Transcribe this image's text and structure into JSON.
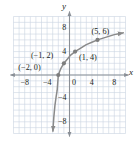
{
  "figure": {
    "title": "",
    "axis_labels": {
      "x": "x",
      "y": "y"
    },
    "colors": {
      "grid": "#c9d4e0",
      "axis": "#8a8f96",
      "curve": "#8a8a8a",
      "point": "#7d7d7d",
      "text": "#231f20",
      "background": "#ffffff"
    }
  },
  "chart_data": {
    "type": "line",
    "title": "",
    "xlabel": "x",
    "ylabel": "y",
    "xlim": [
      -10,
      10
    ],
    "ylim": [
      -10,
      10
    ],
    "grid": true,
    "grid_step": 1,
    "legend": "none",
    "xticks": [
      -8,
      -4,
      0,
      4,
      8
    ],
    "xtick_labels": [
      "-8",
      "-4",
      "0",
      "4",
      "8"
    ],
    "yticks": [
      8,
      4,
      -4,
      -8
    ],
    "ytick_labels": [
      "8",
      "4",
      "-4",
      "-8"
    ],
    "origin_label": "0",
    "asymptote": {
      "type": "vertical",
      "x": -3
    },
    "series": [
      {
        "name": "curve",
        "x": [
          -2.96,
          -2.9,
          -2.8,
          -2.6,
          -2.4,
          -2.2,
          -2,
          -1.6,
          -1.2,
          -1,
          -0.4,
          0.2,
          1,
          2,
          3,
          4,
          5,
          6,
          7,
          8,
          9,
          9.6
        ],
        "y": [
          -9.6,
          -8.6,
          -7.2,
          -5.2,
          -3.8,
          -2.6,
          0,
          1.0,
          1.7,
          2,
          2.7,
          3.4,
          4,
          4.6,
          5.2,
          5.6,
          6,
          6.3,
          6.6,
          6.9,
          7.1,
          7.2
        ],
        "arrow_start": "down",
        "arrow_end": "right"
      }
    ],
    "points": [
      {
        "label": "(-2, 0)",
        "x": -2,
        "y": 0
      },
      {
        "label": "(-1, 2)",
        "x": -1,
        "y": 2
      },
      {
        "label": "(1, 4)",
        "x": 1,
        "y": 4
      },
      {
        "label": "(5, 6)",
        "x": 5,
        "y": 6
      }
    ]
  }
}
